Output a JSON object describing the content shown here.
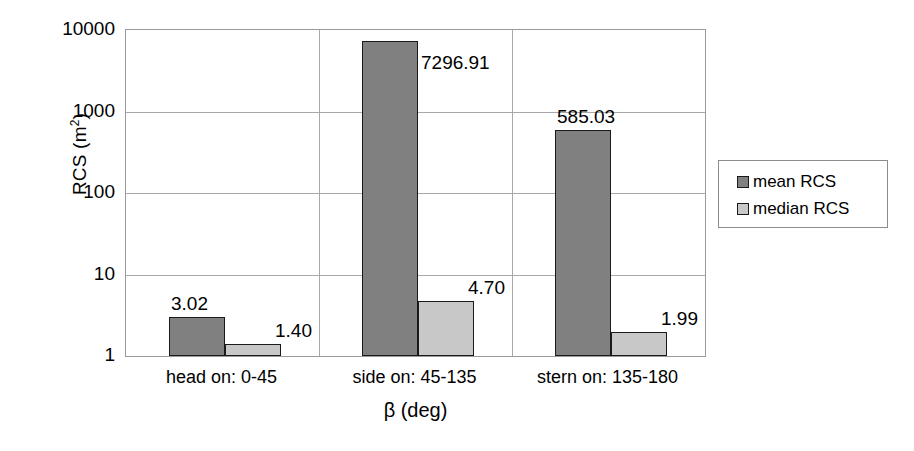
{
  "chart_data": {
    "type": "bar",
    "title": "",
    "xlabel": "β (deg)",
    "ylabel": "RCS (m²)",
    "ylabel_base": "RCS (m",
    "ylabel_sup": "2",
    "ylabel_close": ")",
    "yscale": "log",
    "ylim": [
      1,
      10000
    ],
    "yticks": [
      {
        "value": 10000,
        "label": "10000"
      },
      {
        "value": 1000,
        "label": "1000"
      },
      {
        "value": 100,
        "label": "100"
      },
      {
        "value": 10,
        "label": "10"
      },
      {
        "value": 1,
        "label": "1"
      }
    ],
    "grid": true,
    "legend_position": "right",
    "categories": [
      "head on:  0-45",
      "side on: 45-135",
      "stern on: 135-180"
    ],
    "series": [
      {
        "name": "mean RCS",
        "color": "#808080",
        "values": [
          3.02,
          7296.91,
          585.03
        ],
        "labels": [
          "3.02",
          "7296.91",
          "585.03"
        ]
      },
      {
        "name": "median RCS",
        "color": "#c8c8c8",
        "values": [
          1.4,
          4.7,
          1.99
        ],
        "labels": [
          "1.40",
          "4.70",
          "1.99"
        ]
      }
    ]
  },
  "legend": {
    "items": [
      {
        "label": "mean RCS",
        "color": "#808080"
      },
      {
        "label": "median RCS",
        "color": "#c8c8c8"
      }
    ]
  },
  "colors": {
    "mean": "#808080",
    "median": "#c8c8c8",
    "grid": "#a8a8a8",
    "bar_border": "#1a1a1a",
    "background": "#ffffff"
  }
}
